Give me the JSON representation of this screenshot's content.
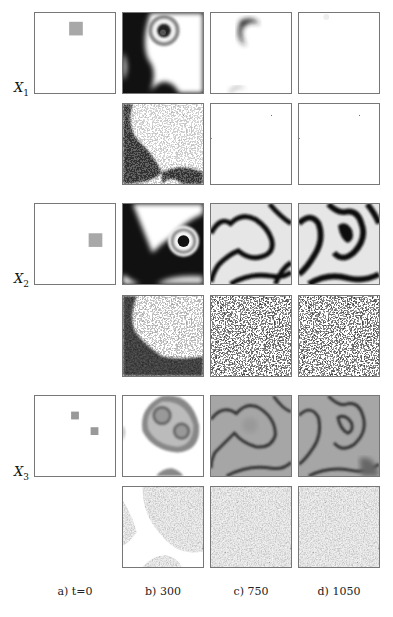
{
  "figure": {
    "rows": [
      {
        "label": "X",
        "sub": "1"
      },
      {
        "label": "X",
        "sub": "2"
      },
      {
        "label": "X",
        "sub": "3"
      }
    ],
    "columns": [
      {
        "label": "a) t=0"
      },
      {
        "label": "b) 300"
      },
      {
        "label": "c) 750"
      },
      {
        "label": "d) 1050"
      }
    ],
    "colors": {
      "border": "#777777",
      "seed": "#a8a8a8",
      "dark": "#111111",
      "mid_gray": "#8a8a8a",
      "light": "#ffffff"
    }
  }
}
